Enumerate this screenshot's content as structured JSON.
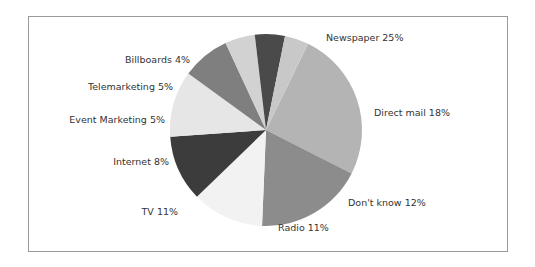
{
  "chart_data": {
    "type": "pie",
    "title": "",
    "xlabel": "",
    "ylabel": "",
    "legend": "none (direct slice labels)",
    "categories": [
      "Newspaper",
      "Direct mail",
      "Don't know",
      "Radio",
      "TV",
      "Internet",
      "Event Marketing",
      "Telemarketing",
      "Billboards"
    ],
    "values": [
      25,
      18,
      12,
      11,
      11,
      8,
      5,
      5,
      4
    ],
    "unit": "%",
    "labels": [
      "Newspaper 25%",
      "Direct mail 18%",
      "Don't know 12%",
      "Radio 11%",
      "TV 11%",
      "Internet 8%",
      "Event Marketing 5%",
      "Telemarketing 5%",
      "Billboards 4%"
    ],
    "colors": [
      "#b4b4b4",
      "#8c8c8c",
      "#f2f2f2",
      "#3c3c3c",
      "#e6e6e6",
      "#7f7f7f",
      "#d2d2d2",
      "#4a4a4a",
      "#c8c8c8"
    ],
    "start_angle_deg": -64,
    "direction": "clockwise"
  }
}
